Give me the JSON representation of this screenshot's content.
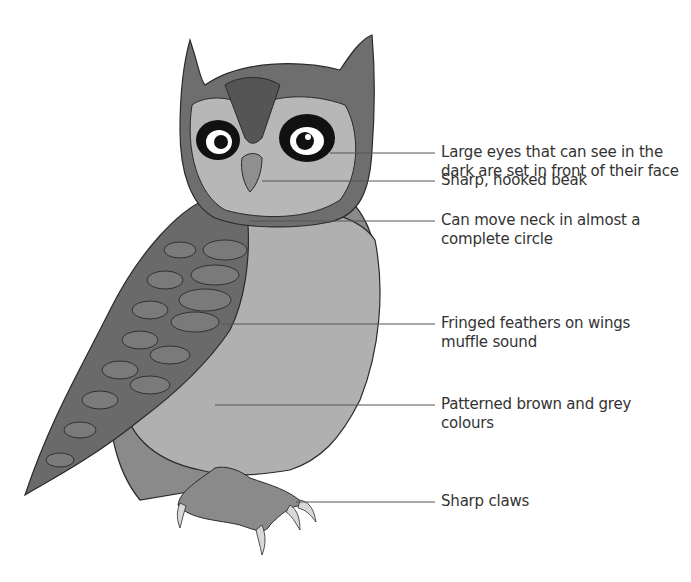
{
  "diagram": {
    "labels": [
      {
        "id": "eyes",
        "line1": "Large eyes that can see in the",
        "line2": "dark are set in front of their face"
      },
      {
        "id": "beak",
        "line1": "Sharp, hooked beak",
        "line2": ""
      },
      {
        "id": "neck",
        "line1": "Can move neck in almost a",
        "line2": "complete circle"
      },
      {
        "id": "feathers",
        "line1": "Fringed feathers on wings",
        "line2": "muffle sound"
      },
      {
        "id": "colours",
        "line1": "Patterned brown and grey",
        "line2": "colours"
      },
      {
        "id": "claws",
        "line1": "Sharp claws",
        "line2": ""
      }
    ],
    "colors": {
      "dark": "#5e5e5e",
      "mid": "#7d7d7d",
      "light": "#a8a8a8",
      "pale": "#c4c4c4",
      "outline": "#2a2a2a",
      "leader_line": "#555555"
    }
  }
}
